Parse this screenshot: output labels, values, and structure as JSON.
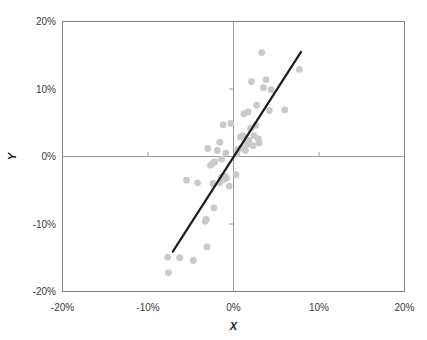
{
  "chart_data": {
    "type": "scatter",
    "title": "",
    "xlabel": "X",
    "ylabel": "Y",
    "xlim": [
      -20,
      20
    ],
    "ylim": [
      -20,
      20
    ],
    "grid": false,
    "legend": null,
    "x_ticks": [
      -20,
      -10,
      0,
      10,
      20
    ],
    "y_ticks": [
      -20,
      -10,
      0,
      10,
      20
    ],
    "x_tick_labels": [
      "-20%",
      "-10%",
      "0%",
      "10%",
      "20%"
    ],
    "y_tick_labels": [
      "-20%",
      "-10%",
      "0%",
      "10%",
      "20%"
    ],
    "point_color": "#c9c9c9",
    "line_color": "#1c1c1c",
    "axis_color": "#808080",
    "series": [
      {
        "name": "observations",
        "points": [
          [
            -7.6,
            -17.2
          ],
          [
            -7.7,
            -14.9
          ],
          [
            -6.3,
            -15.0
          ],
          [
            -4.7,
            -15.4
          ],
          [
            -3.1,
            -13.4
          ],
          [
            -2.3,
            -7.6
          ],
          [
            -5.5,
            -3.5
          ],
          [
            -4.2,
            -3.9
          ],
          [
            -3.3,
            -9.6
          ],
          [
            -3.2,
            -9.3
          ],
          [
            -2.4,
            -4.0
          ],
          [
            -1.6,
            -3.9
          ],
          [
            -1.4,
            -3.1
          ],
          [
            -1.1,
            -3.4
          ],
          [
            -1.0,
            -2.9
          ],
          [
            -0.8,
            -3.2
          ],
          [
            -0.5,
            -4.4
          ],
          [
            -2.7,
            -1.3
          ],
          [
            -2.4,
            -1.0
          ],
          [
            -2.2,
            -0.8
          ],
          [
            -3.0,
            1.2
          ],
          [
            -1.9,
            0.9
          ],
          [
            -1.6,
            2.1
          ],
          [
            -1.4,
            -0.4
          ],
          [
            -0.9,
            0.5
          ],
          [
            -1.2,
            4.7
          ],
          [
            -0.3,
            4.9
          ],
          [
            0.3,
            -2.7
          ],
          [
            0.4,
            0.4
          ],
          [
            0.5,
            1.0
          ],
          [
            0.8,
            2.9
          ],
          [
            0.9,
            1.3
          ],
          [
            1.1,
            3.1
          ],
          [
            1.2,
            6.3
          ],
          [
            1.4,
            0.9
          ],
          [
            1.6,
            1.8
          ],
          [
            1.7,
            6.6
          ],
          [
            1.8,
            2.4
          ],
          [
            2.0,
            4.2
          ],
          [
            2.1,
            11.1
          ],
          [
            2.3,
            1.6
          ],
          [
            2.4,
            3.1
          ],
          [
            2.6,
            4.6
          ],
          [
            2.7,
            7.6
          ],
          [
            2.9,
            2.6
          ],
          [
            3.0,
            2.0
          ],
          [
            3.3,
            15.4
          ],
          [
            3.5,
            10.2
          ],
          [
            3.8,
            11.4
          ],
          [
            4.2,
            6.8
          ],
          [
            4.4,
            9.9
          ],
          [
            6.0,
            6.9
          ],
          [
            7.7,
            12.9
          ]
        ]
      }
    ],
    "trend_line": {
      "name": "fitted-regression-line",
      "x_start": -7.1,
      "y_start": -14.1,
      "x_end": 7.9,
      "y_end": 15.5
    }
  }
}
